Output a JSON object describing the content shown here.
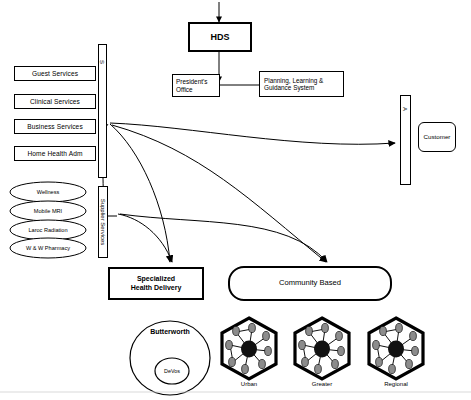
{
  "diagram": {
    "top": {
      "hds_label": "HDS",
      "presidents_office_label": "President's\nOffice",
      "presidents_office_line1": "President's",
      "presidents_office_line2": "Office",
      "planning_line1": "Planning, Learning &",
      "planning_line2": "Guidance System"
    },
    "left_services": [
      {
        "label": "Guest Services"
      },
      {
        "label": "Clinical Services"
      },
      {
        "label": "Business Services"
      },
      {
        "label": "Home Health Adm"
      }
    ],
    "left_ellipses": [
      {
        "label": "Wellness"
      },
      {
        "label": "Mobile MRI"
      },
      {
        "label": "Laroc Radiation"
      },
      {
        "label": "W & W Pharmacy"
      }
    ],
    "channels": {
      "supplier_bar_top_label": "S",
      "supplier_services_label": "Supplier Services",
      "customer_bar_label": "A",
      "customer_box_label": "Customer"
    },
    "delivery": {
      "specialized_line1": "Specialized",
      "specialized_line2": "Health Delivery",
      "community_label": "Community Based"
    },
    "bottom": {
      "butterworth_label": "Butterworth",
      "devos_label": "DeVos",
      "hexagons": [
        {
          "label": "Urban"
        },
        {
          "label": "Greater"
        },
        {
          "label": "Regional"
        }
      ]
    },
    "colors": {
      "stroke": "#000000",
      "background": "#ffffff",
      "hex_node_fill": "#8c8c8c",
      "hub_fill": "#111111"
    }
  }
}
